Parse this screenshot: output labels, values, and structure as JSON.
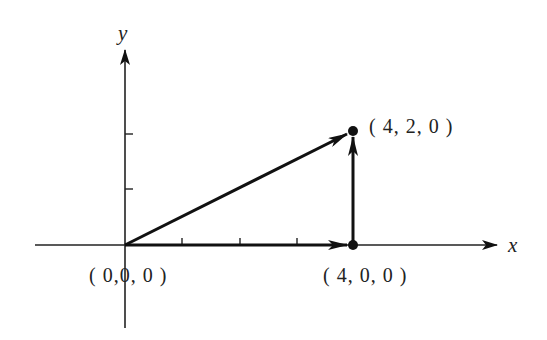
{
  "diagram": {
    "type": "vector-diagram",
    "axes": {
      "x_label": "x",
      "y_label": "y",
      "x_ticks": 3,
      "y_ticks": 2
    },
    "points": [
      {
        "id": "origin",
        "label": "( 0,0, 0 )",
        "coords": [
          0,
          0,
          0
        ]
      },
      {
        "id": "p400",
        "label": "( 4, 0, 0 )",
        "coords": [
          4,
          0,
          0
        ]
      },
      {
        "id": "p420",
        "label": "( 4, 2, 0 )",
        "coords": [
          4,
          2,
          0
        ]
      }
    ],
    "vectors": [
      {
        "from": [
          0,
          0,
          0
        ],
        "to": [
          4,
          0,
          0
        ]
      },
      {
        "from": [
          4,
          0,
          0
        ],
        "to": [
          4,
          2,
          0
        ]
      },
      {
        "from": [
          0,
          0,
          0
        ],
        "to": [
          4,
          2,
          0
        ]
      }
    ],
    "colors": {
      "ink": "#111111",
      "background": "#ffffff"
    }
  }
}
